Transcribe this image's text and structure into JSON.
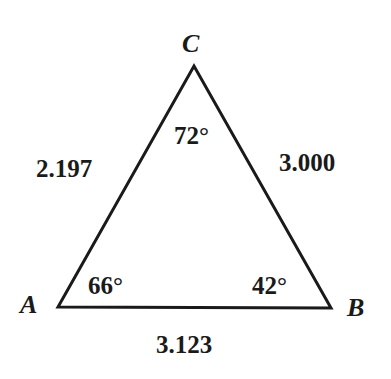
{
  "diagram": {
    "type": "triangle",
    "vertices": [
      {
        "name": "A",
        "x": 58,
        "y": 307
      },
      {
        "name": "B",
        "x": 331,
        "y": 308
      },
      {
        "name": "C",
        "x": 194,
        "y": 66
      }
    ],
    "vertex_labels": {
      "A": "A",
      "B": "B",
      "C": "C"
    },
    "angles": {
      "A": "66°",
      "B": "42°",
      "C": "72°"
    },
    "sides": {
      "AC": "2.197",
      "BC": "3.000",
      "AB": "3.123"
    },
    "colors": {
      "stroke": "#1a1a1a",
      "background": "#ffffff"
    }
  }
}
